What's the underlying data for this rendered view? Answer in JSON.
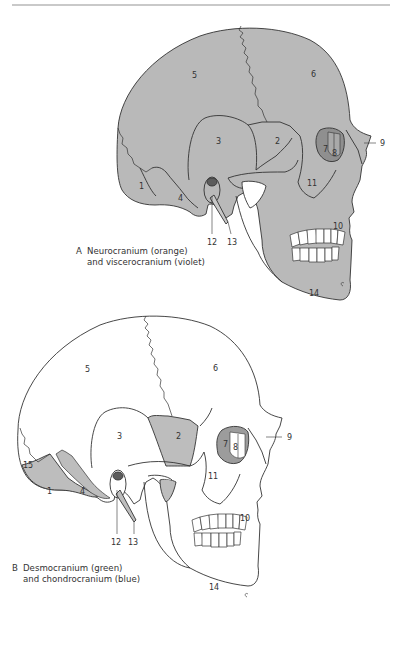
{
  "figure": {
    "colors": {
      "background": "#ffffff",
      "bone_fill_A": "#b9b9b9",
      "bone_fill_B_desmo": "#ffffff",
      "bone_fill_B_chondro": "#bdbdbd",
      "orbit_dark": "#8c8c8c",
      "outline": "#333333",
      "rule": "#c9c9c9"
    },
    "panels": [
      {
        "id": "A",
        "caption_letter": "A",
        "caption_line1": "Neurocranium (orange)",
        "caption_line2": "and viscerocranium (violet)",
        "labels": [
          "1",
          "2",
          "3",
          "4",
          "5",
          "6",
          "7",
          "8",
          "9",
          "10",
          "11",
          "12",
          "13",
          "14"
        ]
      },
      {
        "id": "B",
        "caption_letter": "B",
        "caption_line1": "Desmocranium (green)",
        "caption_line2": "and chondrocranium (blue)",
        "labels": [
          "1",
          "2",
          "3",
          "4",
          "5",
          "6",
          "7",
          "8",
          "9",
          "10",
          "11",
          "12",
          "13",
          "14",
          "15"
        ]
      }
    ]
  },
  "labels": {
    "A": {
      "n1": "1",
      "n2": "2",
      "n3": "3",
      "n4": "4",
      "n5": "5",
      "n6": "6",
      "n7": "7",
      "n8": "8",
      "n9": "9",
      "n10": "10",
      "n11": "11",
      "n12": "12",
      "n13": "13",
      "n14": "14"
    },
    "B": {
      "n1": "1",
      "n2": "2",
      "n3": "3",
      "n4": "4",
      "n5": "5",
      "n6": "6",
      "n7": "7",
      "n8": "8",
      "n9": "9",
      "n10": "10",
      "n11": "11",
      "n12": "12",
      "n13": "13",
      "n14": "14",
      "n15": "15"
    }
  },
  "captions": {
    "A": {
      "letter": "A",
      "line1": "Neurocranium (orange)",
      "line2": "and viscerocranium (violet)"
    },
    "B": {
      "letter": "B",
      "line1": "Desmocranium (green)",
      "line2": "and chondrocranium (blue)"
    }
  }
}
